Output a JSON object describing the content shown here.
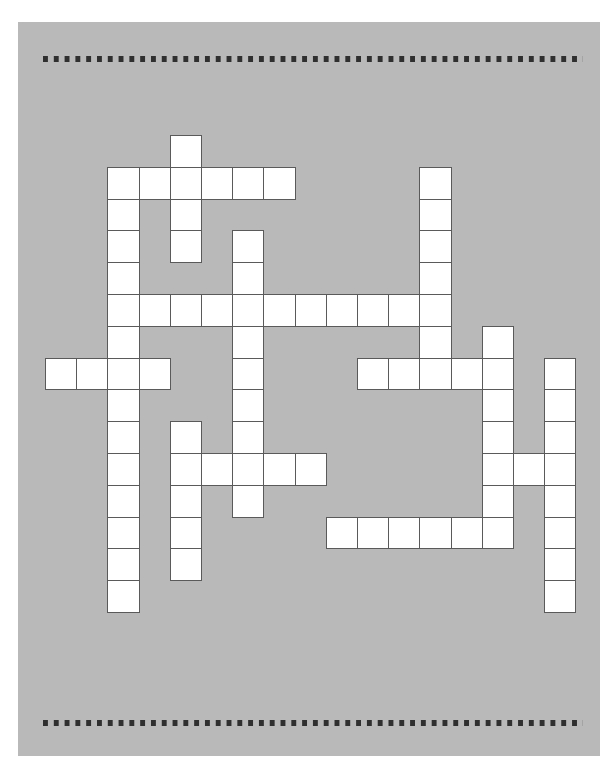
{
  "puzzle": {
    "type": "crossword",
    "cell_size_px": 31.2,
    "row_height_px": 31.8,
    "origin": {
      "x": 45,
      "y": 135
    },
    "colors": {
      "page": "#b9b9b9",
      "cell": "#ffffff",
      "cell_border": "#5a5a5a",
      "dots": "#2f2f2f"
    },
    "words": [
      {
        "dir": "down",
        "row": 0,
        "col": 4,
        "length": 4
      },
      {
        "dir": "across",
        "row": 1,
        "col": 2,
        "length": 6
      },
      {
        "dir": "down",
        "row": 1,
        "col": 2,
        "length": 14
      },
      {
        "dir": "down",
        "row": 1,
        "col": 12,
        "length": 7
      },
      {
        "dir": "down",
        "row": 3,
        "col": 6,
        "length": 9
      },
      {
        "dir": "across",
        "row": 5,
        "col": 3,
        "length": 10
      },
      {
        "dir": "down",
        "row": 6,
        "col": 14,
        "length": 6
      },
      {
        "dir": "across",
        "row": 7,
        "col": 0,
        "length": 4
      },
      {
        "dir": "across",
        "row": 7,
        "col": 10,
        "length": 5
      },
      {
        "dir": "down",
        "row": 7,
        "col": 16,
        "length": 8
      },
      {
        "dir": "down",
        "row": 9,
        "col": 4,
        "length": 5
      },
      {
        "dir": "across",
        "row": 10,
        "col": 4,
        "length": 5
      },
      {
        "dir": "across",
        "row": 10,
        "col": 14,
        "length": 3
      },
      {
        "dir": "across",
        "row": 12,
        "col": 9,
        "length": 6
      }
    ]
  }
}
